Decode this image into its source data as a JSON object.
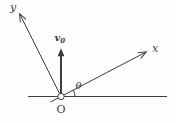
{
  "figure": {
    "labels": {
      "y_axis": "y",
      "x_axis": "x",
      "velocity_main": "v",
      "velocity_subscript": "0",
      "angle": "θ",
      "origin": "O"
    },
    "colors": {
      "background": "#fdfdfd",
      "line": "#3d3d3d",
      "text": "#3d3d3d"
    }
  }
}
